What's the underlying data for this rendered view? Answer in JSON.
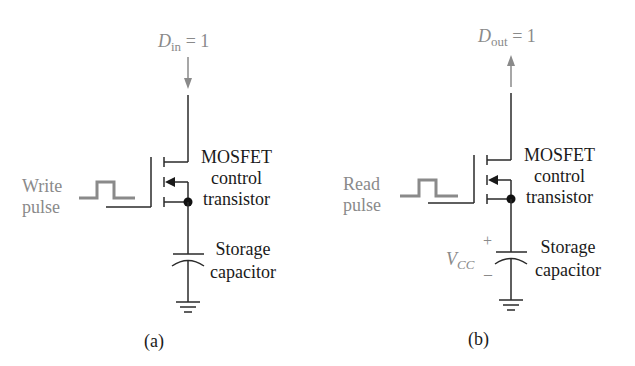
{
  "figure": {
    "panels": [
      {
        "id": "a",
        "caption": "(a)",
        "data_label": {
          "symbol": "D",
          "subscript": "in",
          "value": "= 1",
          "direction": "input"
        },
        "pulse_label": [
          "Write",
          "pulse"
        ],
        "transistor_label": [
          "MOSFET",
          "control",
          "transistor"
        ],
        "capacitor_label": [
          "Storage",
          "capacitor"
        ]
      },
      {
        "id": "b",
        "caption": "(b)",
        "data_label": {
          "symbol": "D",
          "subscript": "out",
          "value": "= 1",
          "direction": "output"
        },
        "pulse_label": [
          "Read",
          "pulse"
        ],
        "transistor_label": [
          "MOSFET",
          "control",
          "transistor"
        ],
        "capacitor_label": [
          "Storage",
          "capacitor"
        ],
        "voltage_label": {
          "symbol": "V",
          "subscript": "CC",
          "plus": "+",
          "minus": "–"
        }
      }
    ],
    "colors": {
      "line": "#2a2a2a",
      "gray": "#8a8a8a",
      "background": "#ffffff"
    }
  }
}
